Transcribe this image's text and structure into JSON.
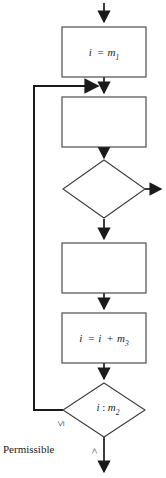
{
  "diagram": {
    "caption": "Permissible",
    "colors": {
      "background": "#ffffff",
      "box_stroke": "#3d3d3d",
      "connector": "#1a1a1a",
      "text": "#1a1a1a"
    },
    "nodes": [
      {
        "id": "init",
        "kind": "process",
        "label_parts": {
          "lhs": "i",
          "op": "=",
          "rhs_base": "m",
          "rhs_sub": "1"
        },
        "label_text": "i = m1"
      },
      {
        "id": "body-top",
        "kind": "process",
        "label_parts": {
          "lhs": "",
          "op": "",
          "rhs_base": "",
          "rhs_sub": ""
        },
        "label_text": ""
      },
      {
        "id": "test-upper",
        "kind": "decision",
        "label_parts": {
          "lhs": "",
          "op": "",
          "rhs_base": "",
          "rhs_sub": ""
        },
        "label_text": ""
      },
      {
        "id": "body-bottom",
        "kind": "process",
        "label_parts": {
          "lhs": "",
          "op": "",
          "rhs_base": "",
          "rhs_sub": ""
        },
        "label_text": ""
      },
      {
        "id": "increment",
        "kind": "process",
        "label_parts": {
          "lhs": "i",
          "op": "=",
          "mid": "i",
          "op2": "+",
          "rhs_base": "m",
          "rhs_sub": "3"
        },
        "label_text": "i = i + m3"
      },
      {
        "id": "test-lower",
        "kind": "decision",
        "label_parts": {
          "lhs": "i",
          "op": ":",
          "rhs_base": "m",
          "rhs_sub": "2"
        },
        "label_text": "i : m2"
      }
    ],
    "branch_labels": {
      "loop_back": "≤",
      "exit": ">"
    }
  }
}
